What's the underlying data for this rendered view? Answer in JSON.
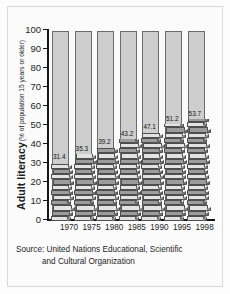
{
  "chart_data": {
    "type": "bar",
    "title": "",
    "ylabel": "Adult literacy",
    "ylabel_sub": "(% of population 15 years or older)",
    "xlabel": "",
    "categories": [
      "1970",
      "1975",
      "1980",
      "1985",
      "1990",
      "1995",
      "1998"
    ],
    "values": [
      31.4,
      35.3,
      39.2,
      43.2,
      47.1,
      51.2,
      53.7
    ],
    "value_labels": [
      "31.4",
      "35.3",
      "39.2",
      "43.2",
      "47.1",
      "51.2",
      "53.7"
    ],
    "series": [
      {
        "name": "Adult literacy rate",
        "values": [
          31.4,
          35.3,
          39.2,
          43.2,
          47.1,
          51.2,
          53.7
        ]
      }
    ],
    "ylim": [
      0,
      100
    ],
    "yticks": [
      0,
      10,
      20,
      30,
      40,
      50,
      60,
      70,
      80,
      90,
      100
    ],
    "ytick_labels": [
      "0",
      "10",
      "20",
      "30",
      "40",
      "50",
      "60",
      "70",
      "80",
      "90",
      "100"
    ],
    "grid": false,
    "legend": false,
    "bar_background_note": "Each bar is drawn to 100% in light grey; the filled value is rendered as a stack of 3-D books.",
    "colors": {
      "bar_background": "#cecece",
      "bar_outline": "#6b6b6b",
      "book_light": "#e3e3e3",
      "book_dark": "#9c9c9c",
      "book_outline": "#4e4e4e",
      "axis": "#161616",
      "page_background": "#fbfbfb",
      "text": "#1b1b1b"
    }
  },
  "source": {
    "line1": "Source: United Nations Educational, Scientific",
    "line2": "and Cultural Organization"
  }
}
